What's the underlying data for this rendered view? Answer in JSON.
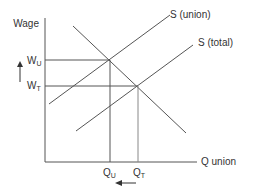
{
  "diagram": {
    "title": "",
    "y_axis_label": "Wage",
    "x_axis_label": "Q union",
    "curves": {
      "supply_union": "S (union)",
      "supply_total": "S (total)",
      "demand": ""
    },
    "y_ticks": {
      "w_union": {
        "main": "W",
        "sub": "U"
      },
      "w_total": {
        "main": "W",
        "sub": "T"
      }
    },
    "x_ticks": {
      "q_union": {
        "main": "Q",
        "sub": "U"
      },
      "q_total": {
        "main": "Q",
        "sub": "T"
      }
    },
    "annotations": {
      "wage_arrow": "up",
      "quantity_arrow": "left"
    },
    "colors": {
      "lines": "#555555",
      "text": "#333333"
    }
  }
}
